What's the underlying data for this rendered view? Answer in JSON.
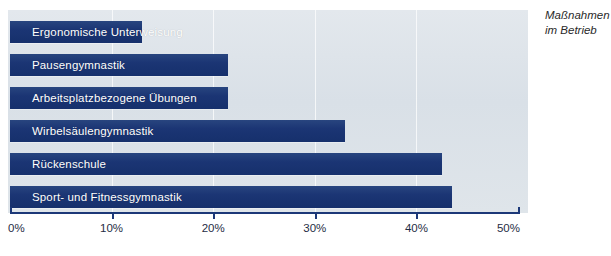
{
  "annotation": {
    "line1": "Maßnahmen",
    "line2": "im Betrieb"
  },
  "chart_data": {
    "type": "bar",
    "orientation": "horizontal",
    "title": "",
    "subtitle": "",
    "xlabel": "",
    "ylabel": "",
    "xlim": [
      0,
      50
    ],
    "grid": true,
    "grid_axis": "x",
    "legend": false,
    "annotations": [
      "Maßnahmen",
      "im Betrieb"
    ],
    "tick_labels": [
      "0%",
      "10%",
      "20%",
      "30%",
      "40%",
      "50%"
    ],
    "tick_values": [
      0,
      10,
      20,
      30,
      40,
      50
    ],
    "categories": [
      "Ergonomische Unterweisung",
      "Pausengymnastik",
      "Arbeitsplatzbezogene Übungen",
      "Wirbelsäulengymnastik",
      "Rückenschule",
      "Sport- und Fitnessgymnastik"
    ],
    "values": [
      13.0,
      21.5,
      21.5,
      33.0,
      42.5,
      43.5
    ],
    "value_unit": "%",
    "colors": {
      "bar": "#1c3878",
      "panel": "#dde3e9",
      "axis": "#1c3878",
      "bar_label": "#ffffff",
      "tick_label": "#1f2d45",
      "gridline": "#ffffff"
    }
  }
}
